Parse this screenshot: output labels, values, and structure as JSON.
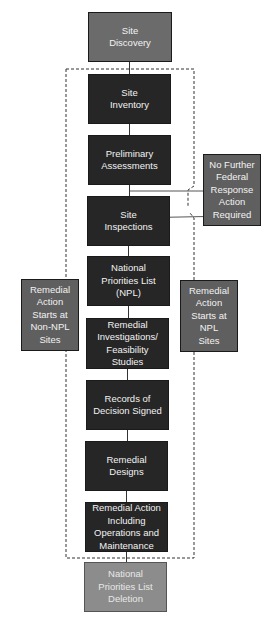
{
  "diagram": {
    "colors": {
      "start_box": "#6b6b6b",
      "process_box": "#262626",
      "side_box": "#5f5f5f",
      "end_box": "#8c8c8c",
      "text": "#f2f2f2",
      "connector": "#333333"
    },
    "nodes": {
      "site_discovery": "Site\nDiscovery",
      "site_inventory": "Site\nInventory",
      "preliminary_assessments": "Preliminary\nAssessments",
      "site_inspections": "Site\nInspections",
      "npl": "National\nPriorities List\n(NPL)",
      "ri_fs": "Remedial\nInvestigations/\nFeasibility\nStudies",
      "records_of_decision": "Records of\nDecision Signed",
      "remedial_designs": "Remedial\nDesigns",
      "remedial_action": "Remedial Action\nIncluding\nOperations and\nMaintenance",
      "npl_deletion": "National\nPriorities List\nDeletion",
      "no_further_action": "No Further\nFederal\nResponse\nAction\nRequired",
      "non_npl_start": "Remedial\nAction\nStarts at\nNon-NPL\nSites",
      "npl_start": "Remedial\nAction\nStarts at\nNPL\nSites"
    }
  }
}
